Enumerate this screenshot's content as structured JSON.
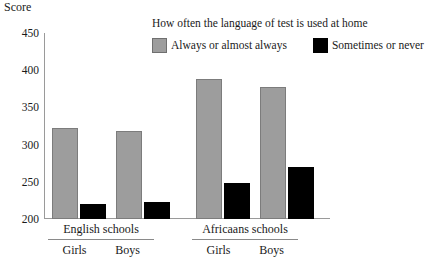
{
  "axis": {
    "score_caption": "Score",
    "ticks": [
      450,
      400,
      350,
      300,
      250,
      200
    ]
  },
  "legend": {
    "title": "How often the language of test is used at home",
    "items": [
      {
        "label": "Always or almost always",
        "swatch": "gray-swatch",
        "color": "#9d9d9d"
      },
      {
        "label": "Sometimes or never",
        "swatch": "black-swatch",
        "color": "#000000"
      }
    ]
  },
  "groups": [
    {
      "name": "English schools",
      "subgroups": [
        "Girls",
        "Boys"
      ]
    },
    {
      "name": "Africaans schools",
      "subgroups": [
        "Girls",
        "Boys"
      ]
    }
  ],
  "chart_data": {
    "type": "bar",
    "title": "",
    "xlabel": "",
    "ylabel": "Score",
    "ylim": [
      200,
      450
    ],
    "yticks": [
      200,
      250,
      300,
      350,
      400,
      450
    ],
    "grid": false,
    "legend_position": "top-right",
    "legend_title": "How often the language of test is used at home",
    "categories": [
      "English schools - Girls",
      "English schools - Boys",
      "Africaans schools - Girls",
      "Africaans schools - Boys"
    ],
    "series": [
      {
        "name": "Always or almost always",
        "color": "#9d9d9d",
        "values": [
          322,
          318,
          388,
          377
        ]
      },
      {
        "name": "Sometimes or never",
        "color": "#000000",
        "values": [
          220,
          223,
          248,
          270
        ]
      }
    ]
  }
}
